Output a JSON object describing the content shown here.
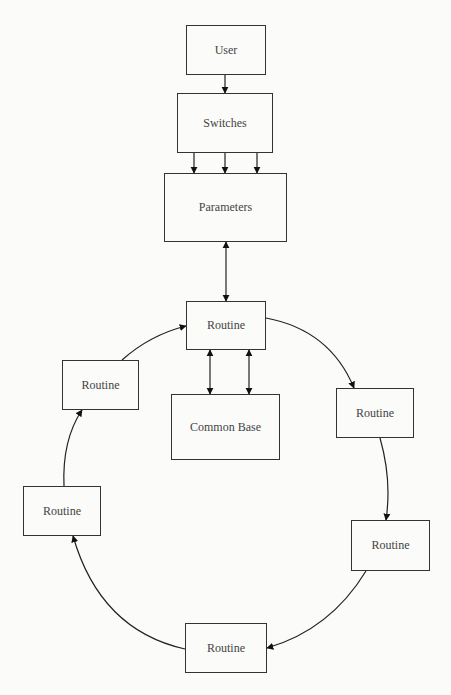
{
  "diagram": {
    "nodes": {
      "user": {
        "label": "User"
      },
      "switches": {
        "label": "Switches"
      },
      "parameters": {
        "label": "Parameters"
      },
      "routine_top": {
        "label": "Routine"
      },
      "common_base": {
        "label": "Common Base"
      },
      "routine_upper_left": {
        "label": "Routine"
      },
      "routine_lower_left": {
        "label": "Routine"
      },
      "routine_upper_right": {
        "label": "Routine"
      },
      "routine_lower_right": {
        "label": "Routine"
      },
      "routine_bottom": {
        "label": "Routine"
      }
    },
    "edges": [
      {
        "from": "user",
        "to": "switches",
        "type": "arrow"
      },
      {
        "from": "switches",
        "to": "parameters",
        "type": "arrow",
        "count": 3
      },
      {
        "from": "parameters",
        "to": "routine_top",
        "type": "bidirectional"
      },
      {
        "from": "routine_top",
        "to": "common_base",
        "type": "bidirectional",
        "count": 2
      },
      {
        "from": "routine_top",
        "to": "routine_upper_right",
        "type": "curved-arrow"
      },
      {
        "from": "routine_upper_right",
        "to": "routine_lower_right",
        "type": "curved-arrow"
      },
      {
        "from": "routine_lower_right",
        "to": "routine_bottom",
        "type": "curved-arrow"
      },
      {
        "from": "routine_bottom",
        "to": "routine_lower_left",
        "type": "curved-arrow"
      },
      {
        "from": "routine_lower_left",
        "to": "routine_upper_left",
        "type": "curved-arrow"
      },
      {
        "from": "routine_upper_left",
        "to": "routine_top",
        "type": "curved-arrow"
      }
    ]
  }
}
